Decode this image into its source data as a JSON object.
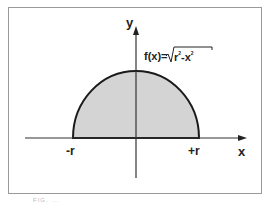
{
  "diagram": {
    "type": "semicircle-area",
    "function_label": "f(x)=",
    "sqrt_content": {
      "r": "r",
      "r_exp": "2",
      "minus": "-",
      "x": "x",
      "x_exp": "2"
    },
    "axes": {
      "x_label": "x",
      "y_label": "y"
    },
    "ticks": {
      "left": "-r",
      "right": "+r"
    },
    "colors": {
      "fill": "#d4d4d4",
      "stroke": "#1a1a1a",
      "axis": "#333333",
      "frame": "#9a9a9a"
    }
  },
  "caption": "FIG. ..."
}
